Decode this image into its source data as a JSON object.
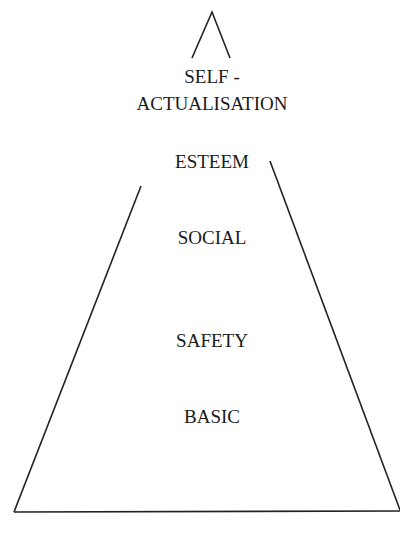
{
  "diagram": {
    "type": "pyramid",
    "levels": [
      {
        "id": "self-actualisation",
        "line1": "SELF -",
        "line2": "ACTUALISATION"
      },
      {
        "id": "esteem",
        "label": "ESTEEM"
      },
      {
        "id": "social",
        "label": "SOCIAL"
      },
      {
        "id": "safety",
        "label": "SAFETY"
      },
      {
        "id": "basic",
        "label": "BASIC"
      }
    ],
    "line_color": "#222222",
    "text_color": "#1a1a1a"
  }
}
